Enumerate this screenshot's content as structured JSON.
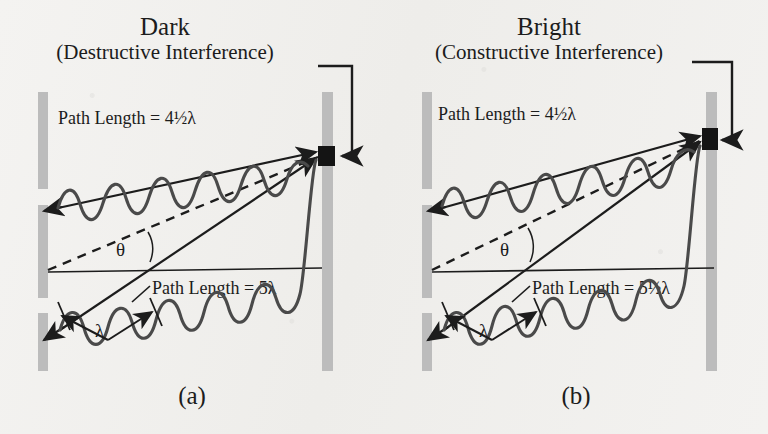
{
  "figure": {
    "kind": "double-slit-interference-diagram",
    "background_color": "#f2f1ef",
    "ink_color": "#1c1c1c",
    "barrier_color": "#bcbcbc",
    "spot_color": "#141414"
  },
  "panels": [
    {
      "id": "a",
      "caption": "(a)",
      "title_main": "Dark",
      "title_sub": "(Destructive Interference)",
      "path_upper_label": "Path Length = 4½λ",
      "path_lower_label": "Path Length = 5λ",
      "angle_symbol": "θ",
      "wavelength_symbol": "λ",
      "upper_path_wavelengths": 4.5,
      "lower_path_wavelengths": 5,
      "interference": "destructive",
      "path_difference_wavelengths": 0.5
    },
    {
      "id": "b",
      "caption": "(b)",
      "title_main": "Bright",
      "title_sub": "(Constructive Interference)",
      "path_upper_label": "Path Length = 4½λ",
      "path_lower_label": "Path Length = 5½λ",
      "angle_symbol": "θ",
      "wavelength_symbol": "λ",
      "upper_path_wavelengths": 4.5,
      "lower_path_wavelengths": 5.5,
      "interference": "constructive",
      "path_difference_wavelengths": 1
    }
  ],
  "elements": {
    "left_barrier_name": "double-slit-barrier",
    "right_barrier_name": "detection-screen",
    "spot_name": "detection-point",
    "leader_name": "title-leader-line",
    "axis_name": "horizontal-reference-axis",
    "dashed_name": "dashed-center-line"
  }
}
